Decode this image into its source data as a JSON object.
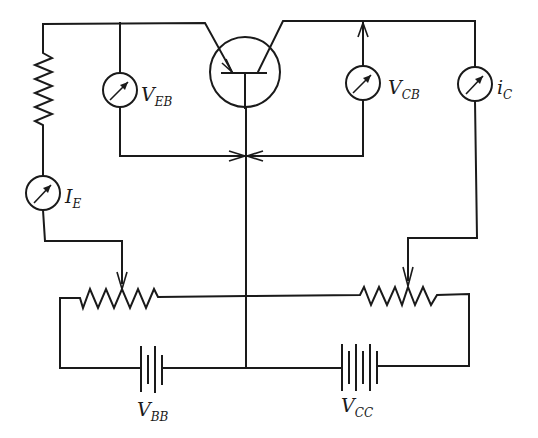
{
  "diagram": {
    "components": {
      "transistor": {
        "type": "pnp-bjt",
        "terminals": [
          "emitter",
          "base",
          "collector"
        ]
      },
      "emitter_resistor": {
        "type": "resistor"
      },
      "meter_veb": {
        "type": "meter",
        "label_main": "V",
        "label_sub": "EB"
      },
      "meter_ie": {
        "type": "meter",
        "label_main": "I",
        "label_sub": "E"
      },
      "meter_vcb": {
        "type": "meter",
        "label_main": "V",
        "label_sub": "CB"
      },
      "meter_ic": {
        "type": "meter",
        "label_main": "i",
        "label_sub": "C"
      },
      "pot_left": {
        "type": "potentiometer"
      },
      "pot_right": {
        "type": "potentiometer"
      },
      "battery_vbb": {
        "type": "battery",
        "label_main": "V",
        "label_sub": "BB"
      },
      "battery_vcc": {
        "type": "battery",
        "label_main": "V",
        "label_sub": "CC"
      }
    },
    "colors": {
      "line": "#1a1a1a",
      "background": "#ffffff"
    }
  }
}
